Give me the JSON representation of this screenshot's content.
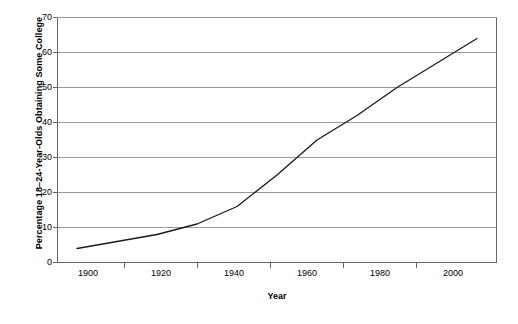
{
  "chart_data": {
    "type": "line",
    "title": "",
    "xlabel": "Year",
    "ylabel": "Percentage 18–24-Year-Olds Obtaining Some College",
    "x": [
      1900,
      1910,
      1920,
      1930,
      1940,
      1950,
      1960,
      1970,
      1980,
      1990,
      2000
    ],
    "values": [
      4,
      6,
      8,
      11,
      16,
      25,
      35,
      42,
      50,
      57,
      64
    ],
    "series": [
      {
        "name": "Percentage 18–24-Year-Olds Obtaining Some College",
        "values": [
          4,
          6,
          8,
          11,
          16,
          25,
          35,
          42,
          50,
          57,
          64
        ]
      }
    ],
    "xlim": [
      1895,
      2005
    ],
    "ylim": [
      0,
      70
    ],
    "xticks": [
      1900,
      1920,
      1940,
      1960,
      1980,
      2000
    ],
    "xtick_labels": [
      "1900",
      "1920",
      "1940",
      "1960",
      "1980",
      "2000"
    ],
    "yticks": [
      0,
      10,
      20,
      30,
      40,
      50,
      60,
      70
    ],
    "ytick_labels": [
      "0",
      "10",
      "20",
      "30",
      "40",
      "50",
      "60",
      "70"
    ],
    "grid": "horizontal",
    "legend": "none",
    "line_color": "#1a1a1a",
    "grid_color": "#999999",
    "axis_color": "#666666",
    "background_color": "#ffffff"
  }
}
